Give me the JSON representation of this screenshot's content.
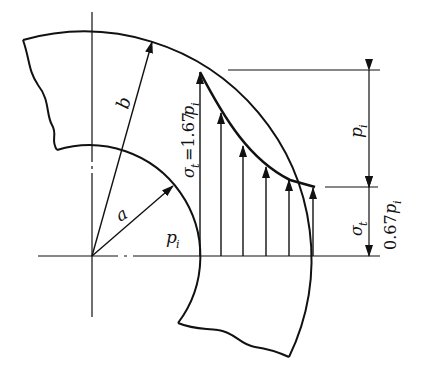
{
  "diagram": {
    "labels": {
      "outer_radius": "b",
      "inner_radius": "a",
      "internal_pressure": "p",
      "internal_pressure_sub": "i",
      "max_stress": "σ",
      "max_stress_sub": "t",
      "max_stress_eq": "=1.67",
      "max_stress_p": "p",
      "max_stress_p_sub": "i",
      "dim_upper": "p",
      "dim_upper_sub": "i",
      "dim_lower_sigma": "σ",
      "dim_lower_sigma_sub": "t",
      "dim_lower_value": "0.67",
      "dim_lower_p": "p",
      "dim_lower_p_sub": "i"
    },
    "values": {
      "sigma_t_inner": "1.67 p_i",
      "sigma_t_outer": "0.67 p_i",
      "difference": "p_i"
    },
    "colors": {
      "line": "#111111",
      "background": "#ffffff"
    }
  }
}
